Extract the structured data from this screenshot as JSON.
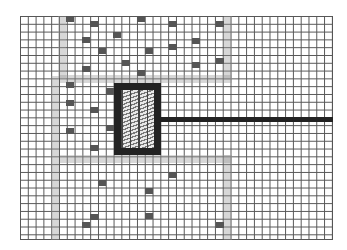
{
  "diagram": {
    "type": "grid-floorplan",
    "grid": {
      "x": 20,
      "y": 16,
      "width": 313,
      "height": 224,
      "cell_w": 7.8,
      "cell_h": 7.8,
      "line_color": "#555555"
    },
    "corridors": [
      {
        "name": "left-upper-vertical",
        "x": 58,
        "y": 16,
        "w": 8,
        "h": 62
      },
      {
        "name": "left-lower-vertical",
        "x": 51,
        "y": 76,
        "w": 8,
        "h": 164
      },
      {
        "name": "upper-horizontal",
        "x": 60,
        "y": 75,
        "w": 172,
        "h": 8
      },
      {
        "name": "lower-horizontal",
        "x": 60,
        "y": 155,
        "w": 172,
        "h": 8
      },
      {
        "name": "right-upper-vertical",
        "x": 224,
        "y": 16,
        "w": 8,
        "h": 64
      },
      {
        "name": "right-lower-vertical",
        "x": 224,
        "y": 155,
        "w": 8,
        "h": 85
      }
    ],
    "marks": [
      {
        "x": 66,
        "y": 16
      },
      {
        "x": 90,
        "y": 21
      },
      {
        "x": 137,
        "y": 16
      },
      {
        "x": 169,
        "y": 21
      },
      {
        "x": 216,
        "y": 21
      },
      {
        "x": 113,
        "y": 32
      },
      {
        "x": 192,
        "y": 38
      },
      {
        "x": 169,
        "y": 44
      },
      {
        "x": 82,
        "y": 37
      },
      {
        "x": 98,
        "y": 48
      },
      {
        "x": 145,
        "y": 48
      },
      {
        "x": 216,
        "y": 58
      },
      {
        "x": 122,
        "y": 60
      },
      {
        "x": 82,
        "y": 66
      },
      {
        "x": 137,
        "y": 70
      },
      {
        "x": 192,
        "y": 62
      },
      {
        "x": 66,
        "y": 82
      },
      {
        "x": 106,
        "y": 88
      },
      {
        "x": 66,
        "y": 100
      },
      {
        "x": 90,
        "y": 107
      },
      {
        "x": 66,
        "y": 128
      },
      {
        "x": 106,
        "y": 125
      },
      {
        "x": 90,
        "y": 145
      },
      {
        "x": 169,
        "y": 172
      },
      {
        "x": 98,
        "y": 180
      },
      {
        "x": 145,
        "y": 188
      },
      {
        "x": 90,
        "y": 214
      },
      {
        "x": 145,
        "y": 213
      },
      {
        "x": 216,
        "y": 222
      },
      {
        "x": 82,
        "y": 222
      }
    ],
    "mark_color": "#555555",
    "central_block": {
      "x": 114,
      "y": 83,
      "w": 47,
      "h": 72,
      "border": 7,
      "color": "#222222"
    },
    "connector_bar": {
      "x": 160,
      "y": 117,
      "w": 173,
      "h": 5,
      "color": "#222222"
    }
  }
}
